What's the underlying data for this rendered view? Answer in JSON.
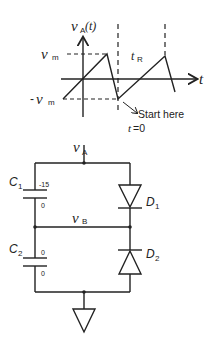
{
  "graph": {
    "y_axis_label": "v",
    "y_axis_label_sub": "A",
    "y_axis_label_arg": "(t)",
    "x_axis_label": "t",
    "vm_pos_label": "v",
    "vm_pos_sub": "m",
    "vm_neg_prefix": "-",
    "vm_neg_label": "v",
    "vm_neg_sub": "m",
    "period_label": "t",
    "period_sub": "R",
    "annotation": "Start here",
    "t0_label": "t",
    "t0_value": "=0"
  },
  "circuit": {
    "input_node_label": "v",
    "input_node_sub": "A",
    "mid_node_label": "v",
    "mid_node_sub": "B",
    "c1": {
      "name": "C",
      "sub": "1",
      "top_value": "-15",
      "bottom_value": "0"
    },
    "c2": {
      "name": "C",
      "sub": "2",
      "top_value": "0",
      "bottom_value": "0"
    },
    "d1": {
      "name": "D",
      "sub": "1"
    },
    "d2": {
      "name": "D",
      "sub": "2"
    },
    "ground": "ground"
  },
  "colors": {
    "stroke": "#222222",
    "background": "#ffffff"
  }
}
